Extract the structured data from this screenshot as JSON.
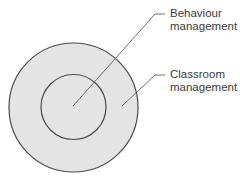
{
  "diagram": {
    "type": "nested-circles",
    "colors": {
      "fill": "#e4e4e4",
      "stroke": "#4a4a4a",
      "text": "#3a3a3a"
    },
    "outer": {
      "label_line1": "Classroom",
      "label_line2": "management"
    },
    "inner": {
      "label_line1": "Behaviour",
      "label_line2": "management"
    }
  }
}
